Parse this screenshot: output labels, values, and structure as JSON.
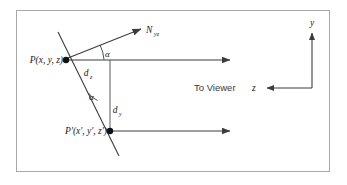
{
  "figure": {
    "frame_color": "#a8a8a8",
    "line_color": "#3c3c3c",
    "text_color": "#1a1a1a"
  },
  "labels": {
    "point_p": "P(x, y, z)",
    "point_p_prime": "P'(x', y', z')",
    "normal_vector": "N",
    "normal_vector_subscript": "yz",
    "distance_z": "d",
    "distance_z_subscript": "z",
    "distance_y": "d",
    "distance_y_subscript": "y",
    "angle_upper": "α",
    "angle_lower": "α",
    "to_viewer": "To Viewer",
    "axis_y": "y",
    "axis_z": "z"
  },
  "geometry": {
    "frame": {
      "x": 16,
      "y": 10,
      "width": 314,
      "height": 162
    },
    "point_p": {
      "x": 66,
      "y": 60
    },
    "point_p_prime": {
      "x": 110,
      "y": 131
    },
    "slanted_line": {
      "x1": 58,
      "y1": 32,
      "x2": 119,
      "y2": 156
    },
    "normal_arrow": {
      "x1": 68,
      "y1": 58,
      "x2": 144,
      "y2": 28
    },
    "top_ray": {
      "x1": 66,
      "y1": 60,
      "x2": 234,
      "y2": 60
    },
    "bottom_ray": {
      "x1": 110,
      "y1": 131,
      "x2": 234,
      "y2": 131
    },
    "vertical_connector": {
      "x": 110,
      "y1": 60,
      "y2": 131
    },
    "axis_y_arrow": {
      "x": 312,
      "y1": 57,
      "y2": 30
    },
    "axis_z_arrow": {
      "x1": 312,
      "y1": 88,
      "x2": 264,
      "y2": 88
    }
  }
}
